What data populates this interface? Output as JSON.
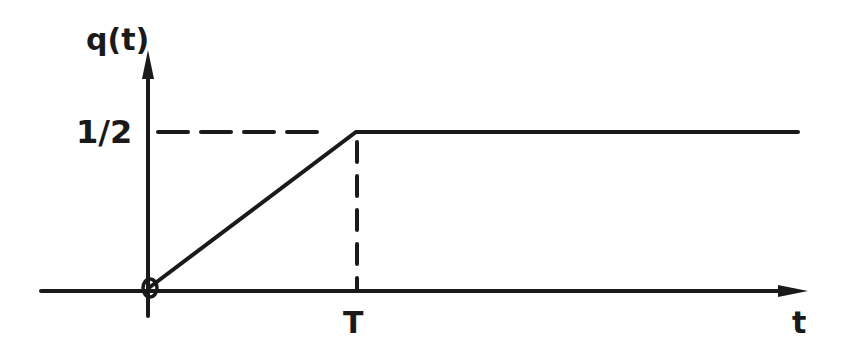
{
  "diagram": {
    "type": "piecewise-function-graph",
    "y_axis_label": "q(t)",
    "x_axis_label": "t",
    "y_level_label": "1/2",
    "x_mark_label": "T",
    "function": {
      "name": "q(t)",
      "segments": [
        {
          "from": {
            "t": "0",
            "q": 0
          },
          "to": {
            "t": "T",
            "q": 0.5
          },
          "kind": "linear-ramp"
        },
        {
          "from": {
            "t": "T",
            "q": 0.5
          },
          "to": {
            "t": "inf",
            "q": 0.5
          },
          "kind": "constant"
        }
      ]
    },
    "guides": [
      {
        "kind": "dashed-horizontal",
        "at_q": "1/2",
        "from_t": "0",
        "to_t": "T"
      },
      {
        "kind": "dashed-vertical",
        "at_t": "T",
        "from_q": 0,
        "to_q": "1/2"
      }
    ],
    "origin_marker": "small-circle",
    "colors": {
      "ink": "#1a1a1a",
      "background": "#ffffff"
    }
  }
}
